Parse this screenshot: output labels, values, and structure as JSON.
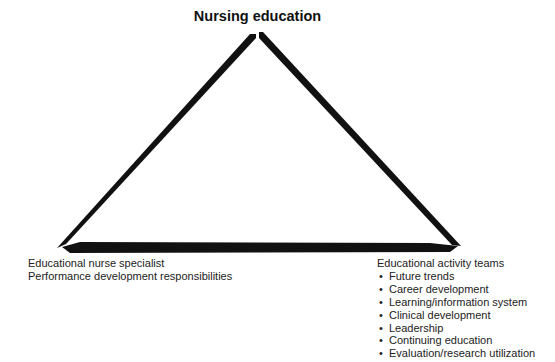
{
  "diagram": {
    "title": "Nursing education",
    "left_vertex": {
      "lines": [
        "Educational nurse specialist",
        "Performance development responsibilities"
      ]
    },
    "right_vertex": {
      "heading": "Educational activity teams",
      "bullet_glyph": "•",
      "items": [
        "Future trends",
        "Career development",
        "Learning/information system",
        "Clinical development",
        "Leadership",
        "Continuing education",
        "Evaluation/research utilization"
      ]
    },
    "colors": {
      "stroke": "#111111",
      "text": "#222222",
      "background": "#ffffff"
    }
  }
}
